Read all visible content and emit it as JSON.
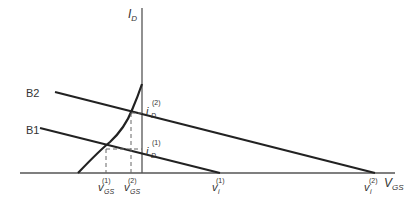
{
  "diagram": {
    "axes": {
      "y_label": "I",
      "y_label_sub": "D",
      "x_label": "V",
      "x_label_sub": "GS"
    },
    "lines": {
      "b2_label": "B2",
      "b1_label": "B1"
    },
    "points": {
      "id2": {
        "main": "i",
        "sub": "D",
        "sup": "(2)"
      },
      "id1": {
        "main": "i",
        "sub": "D",
        "sup": "(1)"
      },
      "vgs1": {
        "main": "v",
        "sub": "GS",
        "sup": "(1)"
      },
      "vgs2": {
        "main": "v",
        "sub": "GS",
        "sup": "(2)"
      },
      "vi1": {
        "main": "v",
        "sub": "i",
        "sup": "(1)"
      },
      "vi2": {
        "main": "v",
        "sub": "i",
        "sup": "(2)"
      }
    },
    "colors": {
      "line": "#222222",
      "axis": "#555555",
      "dashed": "#666666"
    }
  }
}
